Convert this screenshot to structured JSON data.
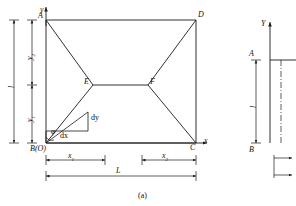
{
  "figure": {
    "caption": "(a)",
    "panel_a": {
      "axis_y_label": "y",
      "axis_x_label": "x",
      "vertices": {
        "A": "A",
        "B": "B(O)",
        "C": "C",
        "D": "D",
        "E": "E",
        "F": "F"
      },
      "dimensions": {
        "total_height": "l",
        "upper_height": "y",
        "upper_height_sub": "2",
        "lower_height": "y",
        "lower_height_sub": "1",
        "left_width": "x",
        "left_width_sub": "1",
        "right_width": "x",
        "right_width_sub": "2",
        "total_width": "L"
      },
      "annotations": {
        "angle": "φ",
        "dx": "dx",
        "dy": "dy"
      }
    },
    "panel_b": {
      "axis_y_label": "Y",
      "point_top": "A",
      "point_bottom": "B",
      "dimension_height": "l"
    }
  },
  "colors": {
    "line": "#1a1a1a",
    "text": "#111111",
    "background": "#ffffff"
  }
}
